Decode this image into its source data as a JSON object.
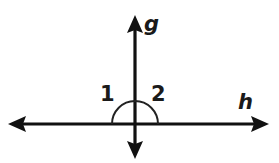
{
  "figure": {
    "canvas": {
      "width": 279,
      "height": 163,
      "background_color": "#ffffff"
    },
    "stroke_color": "#111111",
    "arc_color": "#222222",
    "label_color": "#1a1a1a",
    "intersection": {
      "x": 135,
      "y": 124
    },
    "lines": [
      {
        "name": "g",
        "label": "g",
        "orientation": "vertical",
        "x1": 135,
        "y1": 18,
        "x2": 135,
        "y2": 156,
        "arrow_start": true,
        "arrow_end": true,
        "label_x": 144,
        "label_y": 14
      },
      {
        "name": "h",
        "label": "h",
        "orientation": "horizontal",
        "x1": 10,
        "y1": 124,
        "x2": 267,
        "y2": 124,
        "arrow_start": true,
        "arrow_end": true,
        "label_x": 238,
        "label_y": 92
      }
    ],
    "angle_arc": {
      "center_x": 135,
      "center_y": 124,
      "radius": 23,
      "start_angle_deg": 180,
      "end_angle_deg": 0
    },
    "angles": [
      {
        "label": "1",
        "position": "upper-left",
        "label_x": 100,
        "label_y": 84
      },
      {
        "label": "2",
        "position": "upper-right",
        "label_x": 151,
        "label_y": 84
      }
    ]
  }
}
